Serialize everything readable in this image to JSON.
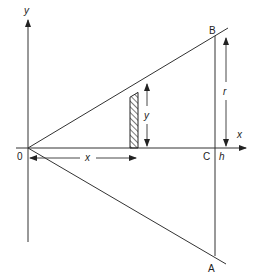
{
  "diagram": {
    "axes": {
      "x_label": "x",
      "y_label": "y"
    },
    "points": {
      "origin": "0",
      "B": "B",
      "A": "A",
      "C": "C"
    },
    "dimensions": {
      "h": "h",
      "r": "r",
      "strip_height": "y",
      "strip_distance": "x"
    },
    "colors": {
      "ink": "#333333",
      "background": "#ffffff"
    }
  }
}
